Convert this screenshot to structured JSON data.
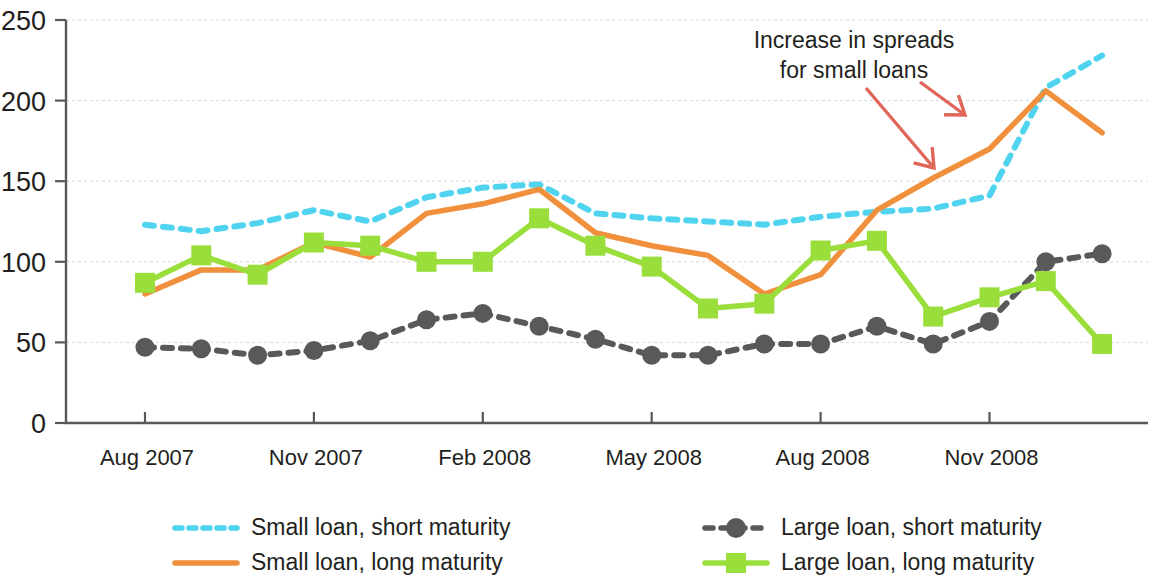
{
  "chart_data": {
    "type": "line",
    "title": "",
    "subtitle": "",
    "xlabel": "",
    "ylabel": "",
    "ylim": [
      0,
      250
    ],
    "yticks": [
      0,
      50,
      100,
      150,
      200,
      250
    ],
    "grid": true,
    "legend_position": "bottom",
    "x": [
      "Aug 2007",
      "Sep 2007",
      "Oct 2007",
      "Nov 2007",
      "Dec 2007",
      "Jan 2008",
      "Feb 2008",
      "Mar 2008",
      "Apr 2008",
      "May 2008",
      "Jun 2008",
      "Jul 2008",
      "Aug 2008",
      "Sep 2008",
      "Oct 2008",
      "Nov 2008",
      "Dec 2008",
      "Jan 2009"
    ],
    "xtick_labels": [
      "Aug 2007",
      "Nov 2007",
      "Feb 2008",
      "May 2008",
      "Aug 2008",
      "Nov 2008"
    ],
    "xtick_indices": [
      0,
      3,
      6,
      9,
      12,
      15
    ],
    "series": [
      {
        "name": "Small loan, short maturity",
        "color": "#4fd3ef",
        "style": "dashed",
        "marker": "none",
        "values": [
          123,
          119,
          124,
          132,
          125,
          140,
          146,
          148,
          130,
          127,
          125,
          123,
          128,
          131,
          133,
          141,
          208,
          228
        ]
      },
      {
        "name": "Small loan, long maturity",
        "color": "#f0903c",
        "style": "solid",
        "marker": "none",
        "values": [
          80,
          95,
          95,
          112,
          103,
          130,
          136,
          145,
          118,
          110,
          104,
          80,
          92,
          132,
          152,
          170,
          206,
          180
        ]
      },
      {
        "name": "Large loan, short maturity",
        "color": "#595959",
        "style": "dashed",
        "marker": "circle",
        "values": [
          47,
          46,
          42,
          45,
          51,
          64,
          68,
          60,
          52,
          42,
          42,
          49,
          49,
          60,
          49,
          63,
          100,
          105
        ]
      },
      {
        "name": "Large loan, long maturity",
        "color": "#9ade3c",
        "style": "solid",
        "marker": "square",
        "values": [
          87,
          104,
          92,
          112,
          110,
          100,
          100,
          127,
          110,
          97,
          71,
          74,
          107,
          113,
          66,
          78,
          88,
          49
        ]
      }
    ],
    "annotations": [
      {
        "text_line1": "Increase in spreads",
        "text_line2": "for small loans",
        "color": "#e0665a"
      }
    ]
  },
  "legend": {
    "items": [
      {
        "label": "Small loan, short maturity",
        "color": "#4fd3ef",
        "style": "dashed",
        "marker": "none"
      },
      {
        "label": "Large loan, short maturity",
        "color": "#595959",
        "style": "dashed",
        "marker": "circle"
      },
      {
        "label": "Small loan, long maturity",
        "color": "#f0903c",
        "style": "solid",
        "marker": "none"
      },
      {
        "label": "Large loan, long maturity",
        "color": "#9ade3c",
        "style": "solid",
        "marker": "square"
      }
    ]
  },
  "axes": {
    "y_tick_labels": [
      "250",
      "200",
      "150",
      "100",
      "50",
      "0"
    ],
    "x_tick_labels": [
      "Aug 2007",
      "Nov 2007",
      "Feb 2008",
      "May 2008",
      "Aug 2008",
      "Nov 2008"
    ]
  }
}
